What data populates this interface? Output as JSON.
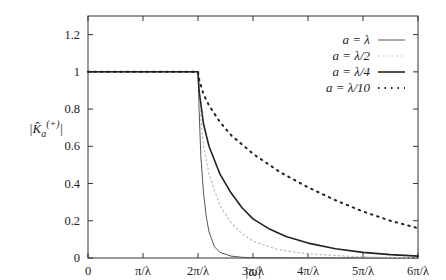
{
  "chart_data": {
    "type": "line",
    "title": "",
    "xlabel": "|ω|",
    "ylabel": "|K̂a(+)|",
    "ylabel_parts": {
      "base": "|K̂",
      "sub": "a",
      "sup": "(+)",
      "end": "|"
    },
    "xlim": [
      0,
      6
    ],
    "xlim_units": "π/λ",
    "ylim": [
      0,
      1.3
    ],
    "x_ticks": [
      {
        "value": 0,
        "label": "0"
      },
      {
        "value": 1,
        "label": "π/λ"
      },
      {
        "value": 2,
        "label": "2π/λ"
      },
      {
        "value": 3,
        "label": "3π/λ"
      },
      {
        "value": 4,
        "label": "4π/λ"
      },
      {
        "value": 5,
        "label": "5π/λ"
      },
      {
        "value": 6,
        "label": "6π/λ"
      }
    ],
    "y_ticks": [
      {
        "value": 0,
        "label": "0"
      },
      {
        "value": 0.2,
        "label": "0.2"
      },
      {
        "value": 0.4,
        "label": "0.4"
      },
      {
        "value": 0.6,
        "label": "0.6"
      },
      {
        "value": 0.8,
        "label": "0.8"
      },
      {
        "value": 1,
        "label": "1"
      },
      {
        "value": 1.2,
        "label": "1.2"
      }
    ],
    "grid": false,
    "legend_position": "top-right",
    "series": [
      {
        "name": "a = λ",
        "style": "solid-thin",
        "color": "#555555",
        "x": [
          0,
          2,
          2.02,
          2.05,
          2.1,
          2.15,
          2.2,
          2.3,
          2.4,
          2.6,
          2.8,
          3.0,
          6
        ],
        "values": [
          1,
          1,
          0.8,
          0.55,
          0.35,
          0.22,
          0.14,
          0.06,
          0.03,
          0.01,
          0.004,
          0.001,
          0
        ]
      },
      {
        "name": "a = λ/2",
        "style": "dotted-light",
        "color": "#bbbbbb",
        "x": [
          0,
          2,
          2.03,
          2.1,
          2.2,
          2.4,
          2.6,
          2.8,
          3.0,
          3.4,
          3.8,
          4.2,
          5,
          6
        ],
        "values": [
          1,
          1,
          0.82,
          0.6,
          0.45,
          0.28,
          0.19,
          0.13,
          0.09,
          0.05,
          0.03,
          0.018,
          0.006,
          0.001
        ]
      },
      {
        "name": "a = λ/4",
        "style": "solid-thick",
        "color": "#222222",
        "x": [
          0,
          2,
          2.02,
          2.1,
          2.2,
          2.4,
          2.6,
          2.8,
          3.0,
          3.3,
          3.6,
          4.0,
          4.5,
          5.0,
          5.5,
          6
        ],
        "values": [
          1,
          1,
          0.9,
          0.72,
          0.6,
          0.45,
          0.35,
          0.27,
          0.21,
          0.155,
          0.115,
          0.08,
          0.05,
          0.03,
          0.018,
          0.01
        ]
      },
      {
        "name": "a = λ/10",
        "style": "dotted-dark",
        "color": "#222222",
        "x": [
          0,
          2,
          2.02,
          2.1,
          2.2,
          2.4,
          2.6,
          3.0,
          3.5,
          4.0,
          4.5,
          5.0,
          5.5,
          6
        ],
        "values": [
          1,
          1,
          0.96,
          0.88,
          0.82,
          0.73,
          0.66,
          0.56,
          0.46,
          0.38,
          0.31,
          0.25,
          0.2,
          0.16
        ]
      }
    ]
  }
}
